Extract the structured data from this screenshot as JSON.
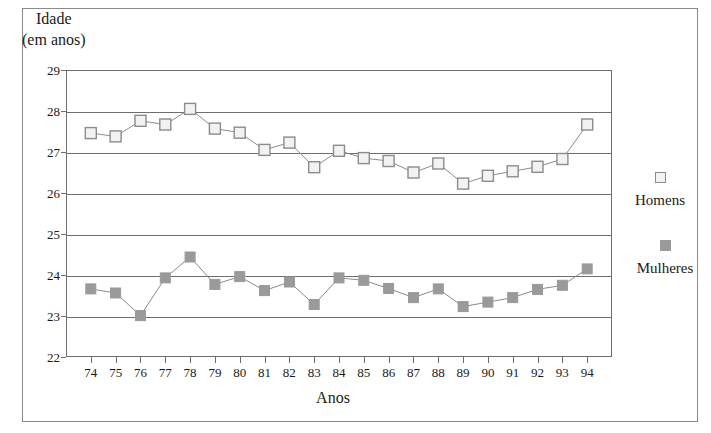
{
  "chart_data": {
    "type": "line",
    "title": "",
    "ylabel_line1": "Idade",
    "ylabel_line2": "(em anos)",
    "xlabel": "Anos",
    "x": [
      "74",
      "75",
      "76",
      "77",
      "78",
      "79",
      "80",
      "81",
      "82",
      "83",
      "84",
      "85",
      "86",
      "87",
      "88",
      "89",
      "90",
      "91",
      "92",
      "93",
      "94"
    ],
    "xtick_labels": [
      "74",
      "75",
      "76",
      "77",
      "78",
      "79",
      "80",
      "81",
      "82",
      "83",
      "84",
      "85",
      "86",
      "87",
      "88",
      "89",
      "90",
      "91",
      "92",
      "93",
      "94"
    ],
    "ytick_labels": [
      "29",
      "28",
      "27",
      "26",
      "25",
      "24",
      "23",
      "22"
    ],
    "ylim": [
      22,
      29
    ],
    "grid": "horizontal",
    "legend_position": "right",
    "series": [
      {
        "name": "Homens",
        "marker": "open-square",
        "color": "#f2f2f2",
        "border_color": "#8c8c8c",
        "values": [
          27.46,
          27.38,
          27.76,
          27.67,
          28.05,
          27.57,
          27.47,
          27.05,
          27.23,
          26.63,
          27.03,
          26.85,
          26.78,
          26.5,
          26.72,
          26.23,
          26.42,
          26.53,
          26.64,
          26.83,
          27.67
        ]
      },
      {
        "name": "Mulheres",
        "marker": "filled-square",
        "color": "#9a9a9a",
        "border_color": "#9a9a9a",
        "values": [
          23.66,
          23.56,
          23.01,
          23.93,
          24.44,
          23.77,
          23.96,
          23.62,
          23.83,
          23.28,
          23.93,
          23.87,
          23.67,
          23.45,
          23.66,
          23.23,
          23.34,
          23.45,
          23.65,
          23.75,
          24.15
        ]
      }
    ]
  },
  "legend": {
    "items": [
      {
        "label": "Homens",
        "swatch": "open-square"
      },
      {
        "label": "Mulheres",
        "swatch": "filled-square"
      }
    ]
  }
}
